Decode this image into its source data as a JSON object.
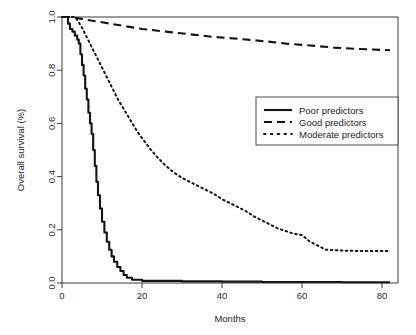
{
  "chart_data": {
    "type": "line",
    "title": "",
    "subtitle": "",
    "xlabel": "Months",
    "ylabel": "Overall survival (%)",
    "xlim": [
      0,
      84
    ],
    "ylim": [
      0,
      1.0
    ],
    "grid": false,
    "legend_position": "right-middle",
    "xticks": [
      0,
      20,
      40,
      60,
      80
    ],
    "xtick_labels": [
      "0",
      "20",
      "40",
      "60",
      "80"
    ],
    "yticks": [
      0.0,
      0.2,
      0.4,
      0.6,
      0.8,
      1.0
    ],
    "ytick_labels": [
      "0.0",
      "0.2",
      "0.4",
      "0.6",
      "0.8",
      "1.0"
    ],
    "series": [
      {
        "name": "Poor predictors",
        "style": "solid",
        "color": "#141414",
        "x": [
          0,
          1.0,
          1.5,
          2.0,
          2.6,
          3.2,
          3.8,
          4.2,
          4.6,
          5.0,
          5.4,
          5.8,
          6.2,
          6.6,
          7.0,
          7.4,
          7.8,
          8.2,
          8.6,
          9.0,
          9.5,
          10.0,
          10.6,
          11.2,
          11.8,
          12.4,
          13.0,
          13.8,
          14.6,
          15.4,
          16.2,
          17.5,
          20.0,
          30.0,
          40.0,
          50.0,
          60.0,
          70.0,
          82.0
        ],
        "y": [
          1.0,
          1.0,
          0.975,
          0.955,
          0.945,
          0.93,
          0.915,
          0.9,
          0.86,
          0.82,
          0.78,
          0.73,
          0.69,
          0.64,
          0.6,
          0.56,
          0.5,
          0.44,
          0.38,
          0.33,
          0.28,
          0.23,
          0.19,
          0.155,
          0.125,
          0.1,
          0.08,
          0.06,
          0.045,
          0.03,
          0.02,
          0.012,
          0.008,
          0.006,
          0.005,
          0.004,
          0.004,
          0.003,
          0.003
        ]
      },
      {
        "name": "Good predictors",
        "style": "dashed",
        "color": "#141414",
        "x": [
          0,
          2.0,
          4.0,
          8.0,
          12.0,
          16.0,
          20.0,
          26.0,
          32.0,
          38.0,
          44.0,
          50.0,
          56.0,
          62.0,
          68.0,
          74.0,
          82.0
        ],
        "y": [
          1.0,
          1.0,
          0.995,
          0.985,
          0.975,
          0.965,
          0.955,
          0.945,
          0.935,
          0.925,
          0.918,
          0.91,
          0.9,
          0.893,
          0.885,
          0.88,
          0.875
        ]
      },
      {
        "name": "Moderate predictors",
        "style": "dotted",
        "color": "#141414",
        "x": [
          0,
          2.0,
          3.2,
          4.0,
          5.0,
          6.0,
          7.0,
          8.0,
          9.0,
          10.0,
          11.0,
          12.0,
          13.0,
          14.0,
          15.0,
          16.0,
          17.0,
          18.0,
          19.0,
          20.0,
          22.0,
          24.0,
          26.0,
          28.0,
          30.0,
          32.0,
          34.0,
          36.0,
          38.0,
          40.0,
          42.0,
          44.0,
          46.0,
          48.0,
          50.0,
          52.0,
          54.0,
          56.0,
          58.0,
          60.0,
          62.0,
          64.0,
          66.0,
          70.0,
          75.0,
          82.0
        ],
        "y": [
          1.0,
          1.0,
          1.0,
          0.985,
          0.96,
          0.93,
          0.9,
          0.87,
          0.84,
          0.81,
          0.78,
          0.75,
          0.72,
          0.69,
          0.665,
          0.64,
          0.615,
          0.59,
          0.565,
          0.545,
          0.505,
          0.47,
          0.44,
          0.415,
          0.395,
          0.38,
          0.365,
          0.35,
          0.335,
          0.315,
          0.3,
          0.285,
          0.27,
          0.25,
          0.235,
          0.22,
          0.205,
          0.195,
          0.185,
          0.18,
          0.155,
          0.14,
          0.125,
          0.122,
          0.12,
          0.12
        ]
      }
    ]
  },
  "legend": {
    "entries": [
      {
        "label": "Poor predictors",
        "style": "solid"
      },
      {
        "label": "Good predictors",
        "style": "dashed"
      },
      {
        "label": "Moderate predictors",
        "style": "dotted"
      }
    ]
  },
  "axes": {
    "x_title": "Months",
    "y_title": "Overall survival (%)"
  }
}
